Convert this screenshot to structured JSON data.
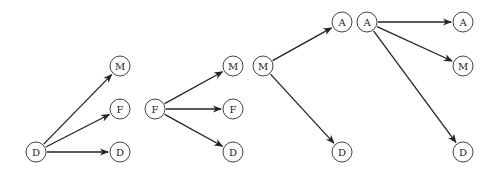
{
  "diagram": {
    "node_radius": 10,
    "groups": [
      {
        "source": {
          "label": "D",
          "x": 36,
          "y": 152
        },
        "targets": [
          {
            "label": "M",
            "x": 120,
            "y": 66
          },
          {
            "label": "F",
            "x": 120,
            "y": 109
          },
          {
            "label": "D",
            "x": 120,
            "y": 152
          }
        ]
      },
      {
        "source": {
          "label": "F",
          "x": 155,
          "y": 109
        },
        "targets": [
          {
            "label": "M",
            "x": 233,
            "y": 66
          },
          {
            "label": "F",
            "x": 233,
            "y": 109
          },
          {
            "label": "D",
            "x": 233,
            "y": 152
          }
        ]
      },
      {
        "source": {
          "label": "M",
          "x": 263,
          "y": 66
        },
        "targets": [
          {
            "label": "A",
            "x": 342,
            "y": 22
          },
          {
            "label": "D",
            "x": 342,
            "y": 152
          }
        ]
      },
      {
        "source": {
          "label": "A",
          "x": 367,
          "y": 22
        },
        "targets": [
          {
            "label": "A",
            "x": 463,
            "y": 22
          },
          {
            "label": "M",
            "x": 463,
            "y": 66
          },
          {
            "label": "D",
            "x": 463,
            "y": 152
          }
        ]
      }
    ]
  }
}
